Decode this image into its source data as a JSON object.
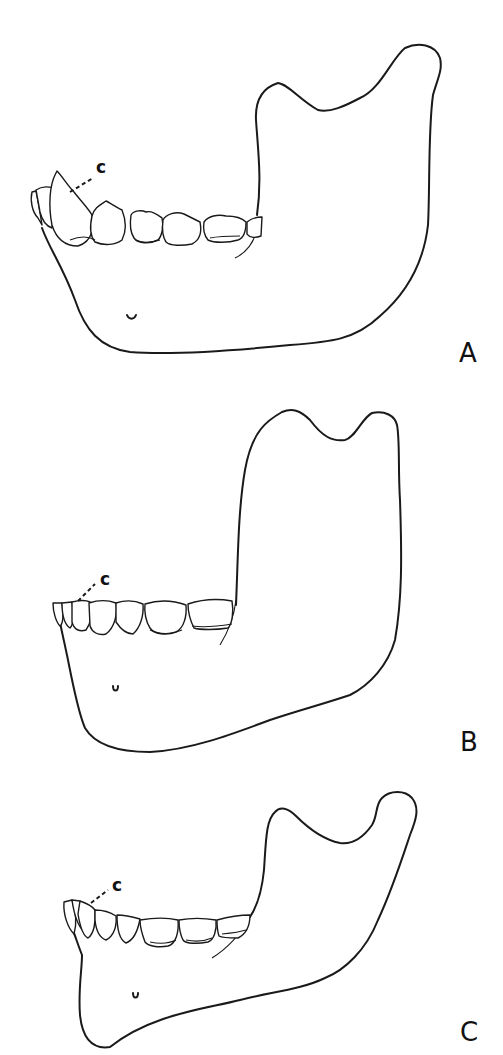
{
  "figure": {
    "panels": [
      {
        "id": "A",
        "label": "A",
        "canine_label": "c"
      },
      {
        "id": "B",
        "label": "B",
        "canine_label": "c"
      },
      {
        "id": "C",
        "label": "C",
        "canine_label": "c"
      }
    ]
  },
  "colors": {
    "ink": "#1a1a1a",
    "background": "#ffffff"
  }
}
